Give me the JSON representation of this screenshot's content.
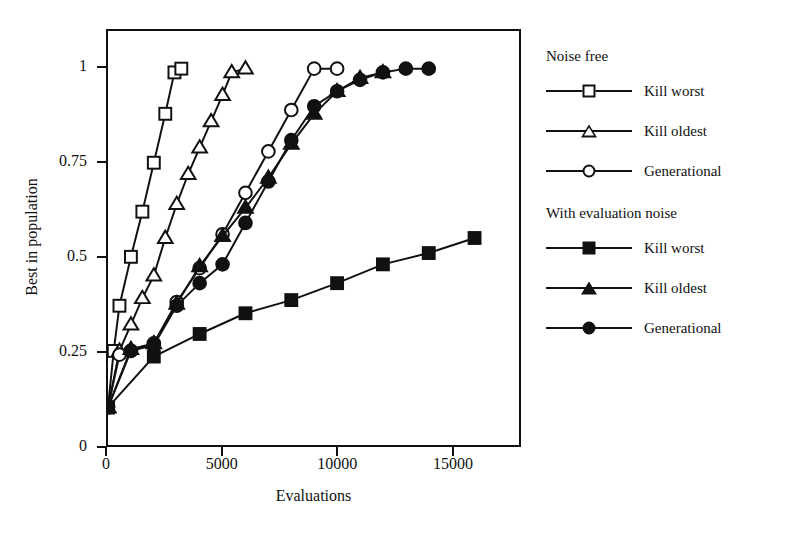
{
  "chart_data": {
    "type": "line",
    "title": "",
    "xlabel": "Evaluations",
    "ylabel": "Best in population",
    "xlim": [
      0,
      17300
    ],
    "ylim": [
      0,
      1.1
    ],
    "xticks": [
      0,
      5000,
      10000,
      15000
    ],
    "xtick_labels": [
      "0",
      "5000",
      "10000",
      "15000"
    ],
    "yticks": [
      0,
      0.25,
      0.5,
      0.75,
      1
    ],
    "ytick_labels": [
      "0",
      "0.25",
      "0.5",
      "0.75",
      "1"
    ],
    "grid": false,
    "legend_position": "right",
    "legend_groups": [
      {
        "title": "Noise free",
        "entries": [
          {
            "label": "Kill worst",
            "marker": "square-open"
          },
          {
            "label": "Kill oldest",
            "marker": "triangle-open"
          },
          {
            "label": "Generational",
            "marker": "circle-open"
          }
        ]
      },
      {
        "title": "With evaluation noise",
        "entries": [
          {
            "label": "Kill worst",
            "marker": "square-filled"
          },
          {
            "label": "Kill oldest",
            "marker": "triangle-filled"
          },
          {
            "label": "Generational",
            "marker": "circle-filled"
          }
        ]
      }
    ],
    "series": [
      {
        "name": "Kill worst",
        "group": "Noise free",
        "marker": "square-open",
        "x": [
          0,
          250,
          500,
          1000,
          1500,
          2000,
          2500,
          2900,
          3200
        ],
        "y": [
          0.1,
          0.25,
          0.37,
          0.5,
          0.62,
          0.75,
          0.88,
          0.99,
          1.0
        ]
      },
      {
        "name": "Kill oldest",
        "group": "Noise free",
        "marker": "triangle-open",
        "x": [
          0,
          500,
          1000,
          1500,
          2000,
          2500,
          3000,
          3500,
          4000,
          4500,
          5000,
          5400,
          6000
        ],
        "y": [
          0.1,
          0.25,
          0.32,
          0.39,
          0.45,
          0.55,
          0.64,
          0.72,
          0.79,
          0.86,
          0.93,
          0.99,
          1.0
        ]
      },
      {
        "name": "Generational",
        "group": "Noise free",
        "marker": "circle-open",
        "x": [
          0,
          500,
          1000,
          2000,
          3000,
          4000,
          5000,
          6000,
          7000,
          8000,
          9000,
          10000
        ],
        "y": [
          0.1,
          0.24,
          0.25,
          0.27,
          0.38,
          0.47,
          0.56,
          0.67,
          0.78,
          0.89,
          1.0,
          1.0
        ]
      },
      {
        "name": "Kill worst",
        "group": "With evaluation noise",
        "marker": "square-filled",
        "x": [
          0,
          2000,
          4000,
          6000,
          8000,
          10000,
          12000,
          14000,
          16000
        ],
        "y": [
          0.1,
          0.235,
          0.295,
          0.35,
          0.385,
          0.43,
          0.48,
          0.51,
          0.55
        ]
      },
      {
        "name": "Kill oldest",
        "group": "With evaluation noise",
        "marker": "triangle-filled",
        "x": [
          0,
          1000,
          2000,
          3000,
          4000,
          5000,
          6000,
          7000,
          8000,
          9000,
          10000,
          11000,
          12000
        ],
        "y": [
          0.1,
          0.255,
          0.27,
          0.375,
          0.475,
          0.555,
          0.63,
          0.71,
          0.8,
          0.88,
          0.94,
          0.975,
          0.99
        ]
      },
      {
        "name": "Generational",
        "group": "With evaluation noise",
        "marker": "circle-filled",
        "x": [
          0,
          1000,
          2000,
          3000,
          4000,
          5000,
          6000,
          7000,
          8000,
          9000,
          10000,
          11000,
          12000,
          13000,
          14000
        ],
        "y": [
          0.1,
          0.25,
          0.265,
          0.37,
          0.43,
          0.48,
          0.59,
          0.7,
          0.81,
          0.9,
          0.94,
          0.97,
          0.99,
          1.0,
          1.0
        ]
      }
    ]
  }
}
